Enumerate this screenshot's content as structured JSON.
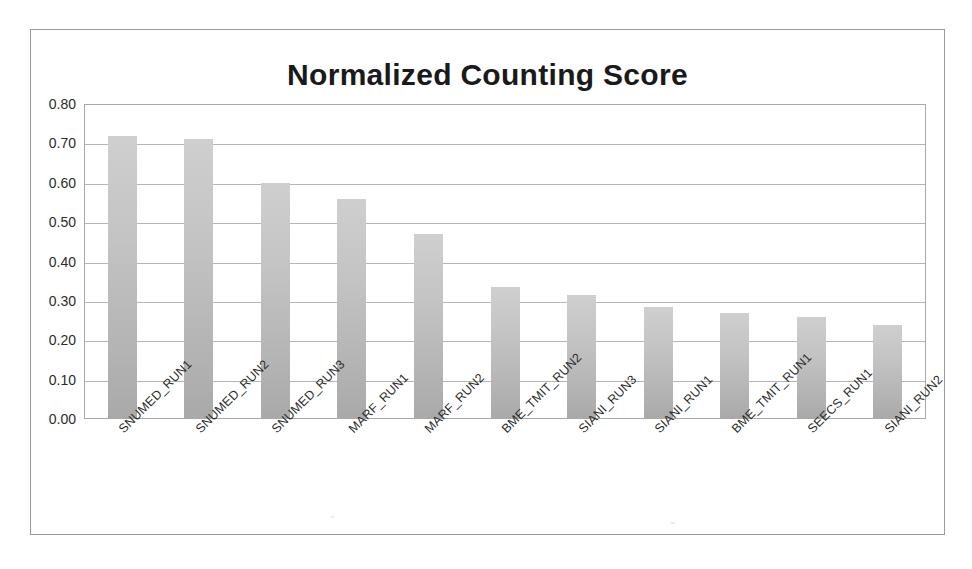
{
  "chart_data": {
    "type": "bar",
    "title": "Normalized Counting Score",
    "xlabel": "",
    "ylabel": "",
    "ylim": [
      0.0,
      0.8
    ],
    "grid": true,
    "legend": "none",
    "orientation": "vertical",
    "bar_color": "#c2c2c2",
    "categories": [
      "SNUMED_RUN1",
      "SNUMED_RUN2",
      "SNUMED_RUN3",
      "MARF_RUN1",
      "MARF_RUN2",
      "BME_TMIT_RUN2",
      "SIANI_RUN3",
      "SIANI_RUN1",
      "BME_TMIT_RUN1",
      "SEECS_RUN1",
      "SIANI_RUN2"
    ],
    "values": [
      0.72,
      0.71,
      0.6,
      0.56,
      0.47,
      0.335,
      0.315,
      0.285,
      0.27,
      0.26,
      0.24
    ],
    "ytick_labels": [
      "0.80",
      "0.70",
      "0.60",
      "0.50",
      "0.40",
      "0.30",
      "0.20",
      "0.10",
      "0.00"
    ],
    "ytick_values": [
      0.8,
      0.7,
      0.6,
      0.5,
      0.4,
      0.3,
      0.2,
      0.1,
      0.0
    ]
  }
}
